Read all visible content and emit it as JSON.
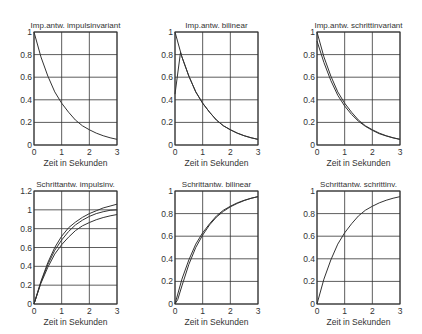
{
  "figure": {
    "background": "#ffffff",
    "line_color": "#333333",
    "grid_color": "#333333"
  },
  "chart_data": [
    {
      "type": "line",
      "title": "Imp.antw. impulsinvariant",
      "xlabel": "Zeit in Sekunden",
      "ylabel": "",
      "xlim": [
        0,
        3
      ],
      "ylim": [
        0,
        1
      ],
      "xticks": [
        "0",
        "1",
        "2",
        "3"
      ],
      "yticks": [
        "0",
        "0.2",
        "0.4",
        "0.6",
        "0.8",
        "1"
      ],
      "grid": true,
      "series": [
        {
          "name": "impulse response",
          "x": [
            0,
            0.25,
            0.5,
            0.75,
            1,
            1.25,
            1.5,
            1.75,
            2,
            2.25,
            2.5,
            2.75,
            3
          ],
          "values": [
            1,
            0.78,
            0.61,
            0.47,
            0.37,
            0.29,
            0.22,
            0.17,
            0.135,
            0.105,
            0.082,
            0.064,
            0.05
          ]
        }
      ]
    },
    {
      "type": "line",
      "title": "Imp.antw. bilinear",
      "xlabel": "Zeit in Sekunden",
      "ylabel": "",
      "xlim": [
        0,
        3
      ],
      "ylim": [
        0,
        1
      ],
      "xticks": [
        "0",
        "1",
        "2",
        "3"
      ],
      "yticks": [
        "0",
        "0.2",
        "0.4",
        "0.6",
        "0.8",
        "1"
      ],
      "grid": true,
      "series": [
        {
          "name": "continuous",
          "x": [
            0,
            0.25,
            0.5,
            0.75,
            1,
            1.25,
            1.5,
            1.75,
            2,
            2.25,
            2.5,
            2.75,
            3
          ],
          "values": [
            1,
            0.78,
            0.61,
            0.47,
            0.37,
            0.29,
            0.22,
            0.17,
            0.135,
            0.105,
            0.082,
            0.064,
            0.05
          ]
        },
        {
          "name": "bilinear",
          "x": [
            0,
            0.2,
            0.25,
            0.5,
            0.75,
            1,
            1.25,
            1.5,
            1.75,
            2,
            2.25,
            2.5,
            2.75,
            3
          ],
          "values": [
            0.45,
            0.82,
            0.78,
            0.61,
            0.47,
            0.37,
            0.29,
            0.22,
            0.17,
            0.135,
            0.105,
            0.082,
            0.064,
            0.05
          ]
        }
      ]
    },
    {
      "type": "line",
      "title": "Imp.antw. schrittinvariant",
      "xlabel": "Zeit in Sekunden",
      "ylabel": "",
      "xlim": [
        0,
        3
      ],
      "ylim": [
        0,
        1
      ],
      "xticks": [
        "0",
        "1",
        "2",
        "3"
      ],
      "yticks": [
        "0",
        "0.2",
        "0.4",
        "0.6",
        "0.8",
        "1"
      ],
      "grid": true,
      "series": [
        {
          "name": "continuous",
          "x": [
            0,
            0.25,
            0.5,
            0.75,
            1,
            1.25,
            1.5,
            1.75,
            2,
            2.25,
            2.5,
            2.75,
            3
          ],
          "values": [
            1,
            0.78,
            0.61,
            0.47,
            0.37,
            0.29,
            0.22,
            0.17,
            0.135,
            0.105,
            0.082,
            0.064,
            0.05
          ]
        },
        {
          "name": "step-invariant",
          "x": [
            0,
            0.25,
            0.5,
            0.75,
            1,
            1.25,
            1.5,
            1.75,
            2,
            2.25,
            2.5,
            2.75,
            3
          ],
          "values": [
            0.92,
            0.73,
            0.57,
            0.44,
            0.345,
            0.27,
            0.21,
            0.165,
            0.13,
            0.1,
            0.08,
            0.063,
            0.05
          ]
        }
      ]
    },
    {
      "type": "line",
      "title": "Schrittantw. impulsinv.",
      "xlabel": "Zeit in Sekunden",
      "ylabel": "",
      "xlim": [
        0,
        3
      ],
      "ylim": [
        0,
        1.2
      ],
      "xticks": [
        "0",
        "1",
        "2",
        "3"
      ],
      "yticks": [
        "0",
        "0.2",
        "0.4",
        "0.6",
        "0.8",
        "1",
        "1.2"
      ],
      "grid": true,
      "series": [
        {
          "name": "upper",
          "x": [
            0,
            0.25,
            0.5,
            0.75,
            1,
            1.25,
            1.5,
            1.75,
            2,
            2.25,
            2.5,
            2.75,
            3
          ],
          "values": [
            0,
            0.24,
            0.44,
            0.6,
            0.72,
            0.81,
            0.87,
            0.92,
            0.96,
            0.99,
            1.02,
            1.04,
            1.06
          ]
        },
        {
          "name": "continuous",
          "x": [
            0,
            0.25,
            0.5,
            0.75,
            1,
            1.25,
            1.5,
            1.75,
            2,
            2.25,
            2.5,
            2.75,
            3
          ],
          "values": [
            0,
            0.22,
            0.39,
            0.53,
            0.63,
            0.71,
            0.78,
            0.83,
            0.865,
            0.895,
            0.918,
            0.936,
            0.95
          ]
        },
        {
          "name": "middle",
          "x": [
            0,
            0.25,
            0.5,
            0.75,
            1,
            1.25,
            1.5,
            1.75,
            2,
            2.25,
            2.5,
            2.75,
            3
          ],
          "values": [
            0,
            0.23,
            0.42,
            0.57,
            0.68,
            0.77,
            0.84,
            0.89,
            0.93,
            0.96,
            0.98,
            0.995,
            1.0
          ]
        }
      ]
    },
    {
      "type": "line",
      "title": "Schrittantw. bilinear",
      "xlabel": "Zeit in Sekunden",
      "ylabel": "",
      "xlim": [
        0,
        3
      ],
      "ylim": [
        0,
        1
      ],
      "xticks": [
        "0",
        "1",
        "2",
        "3"
      ],
      "yticks": [
        "0",
        "0.2",
        "0.4",
        "0.6",
        "0.8",
        "1"
      ],
      "grid": true,
      "series": [
        {
          "name": "continuous",
          "x": [
            0,
            0.25,
            0.5,
            0.75,
            1,
            1.25,
            1.5,
            1.75,
            2,
            2.25,
            2.5,
            2.75,
            3
          ],
          "values": [
            0,
            0.22,
            0.39,
            0.53,
            0.63,
            0.71,
            0.78,
            0.83,
            0.865,
            0.895,
            0.918,
            0.936,
            0.95
          ]
        },
        {
          "name": "bilinear",
          "x": [
            0,
            0.1,
            0.25,
            0.5,
            0.75,
            1,
            1.25,
            1.5,
            1.75,
            2,
            2.25,
            2.5,
            2.75,
            3
          ],
          "values": [
            0,
            0.04,
            0.16,
            0.35,
            0.5,
            0.61,
            0.7,
            0.77,
            0.82,
            0.86,
            0.89,
            0.915,
            0.935,
            0.95
          ]
        }
      ]
    },
    {
      "type": "line",
      "title": "Schrittantw. schrittinv.",
      "xlabel": "Zeit in Sekunden",
      "ylabel": "",
      "xlim": [
        0,
        3
      ],
      "ylim": [
        0,
        1
      ],
      "xticks": [
        "0",
        "1",
        "2",
        "3"
      ],
      "yticks": [
        "0",
        "0.2",
        "0.4",
        "0.6",
        "0.8",
        "1"
      ],
      "grid": true,
      "series": [
        {
          "name": "step response",
          "x": [
            0,
            0.25,
            0.5,
            0.75,
            1,
            1.25,
            1.5,
            1.75,
            2,
            2.25,
            2.5,
            2.75,
            3
          ],
          "values": [
            0,
            0.22,
            0.39,
            0.53,
            0.63,
            0.71,
            0.78,
            0.83,
            0.865,
            0.895,
            0.918,
            0.936,
            0.95
          ]
        }
      ]
    }
  ]
}
